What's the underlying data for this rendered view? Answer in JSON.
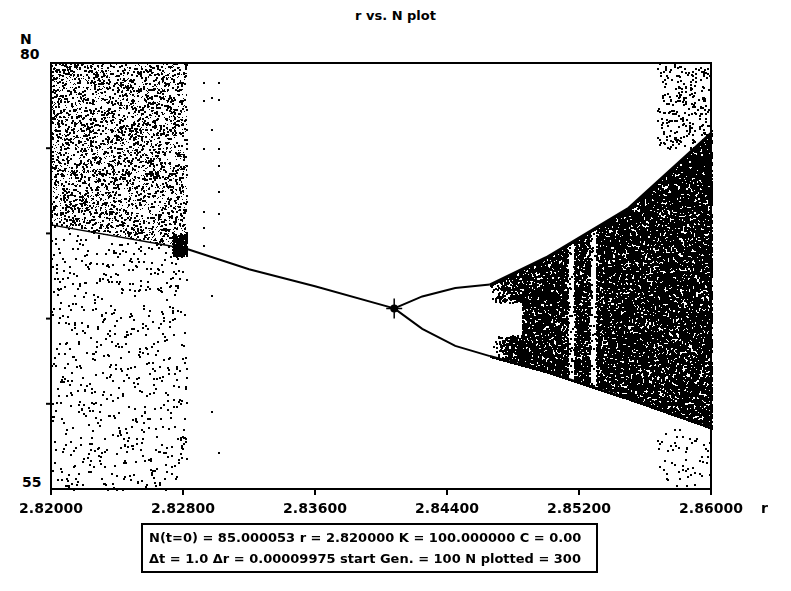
{
  "chart_data": {
    "type": "scatter",
    "title": "r vs. N plot",
    "xlabel": "r",
    "ylabel": "N",
    "xlim": [
      2.82,
      2.86
    ],
    "ylim": [
      55,
      80
    ],
    "x_ticks": [
      "2.82000",
      "2.82800",
      "2.83600",
      "2.84400",
      "2.85200",
      "2.86000"
    ],
    "x_tick_values": [
      2.82,
      2.828,
      2.836,
      2.844,
      2.852,
      2.86
    ],
    "y_tick_labels": [
      "55",
      "80"
    ],
    "y_minor_ticks": [
      60,
      65,
      70,
      75
    ],
    "grid": false,
    "legend": null,
    "features": {
      "chaos_left": {
        "r_range": [
          2.82,
          2.8282
        ],
        "N_range": [
          55,
          80
        ],
        "dense_above_line": [
          [
            2.82,
            70.5
          ],
          [
            2.8282,
            69.1
          ]
        ]
      },
      "stable_branch": [
        [
          2.8282,
          69.1
        ],
        [
          2.832,
          67.9
        ],
        [
          2.836,
          66.9
        ],
        [
          2.8408,
          65.6
        ]
      ],
      "period2_upper": [
        [
          2.8408,
          65.6
        ],
        [
          2.8425,
          66.3
        ],
        [
          2.8445,
          66.8
        ],
        [
          2.8466,
          67.0
        ]
      ],
      "period2_lower": [
        [
          2.8408,
          65.6
        ],
        [
          2.8425,
          64.4
        ],
        [
          2.8445,
          63.4
        ],
        [
          2.8466,
          62.8
        ]
      ],
      "chaos_band_upper": [
        [
          2.8466,
          67.0
        ],
        [
          2.85,
          68.6
        ],
        [
          2.855,
          71.5
        ],
        [
          2.86,
          75.9
        ]
      ],
      "chaos_band_lower": [
        [
          2.8466,
          62.8
        ],
        [
          2.85,
          61.9
        ],
        [
          2.855,
          60.3
        ],
        [
          2.86,
          58.6
        ]
      ],
      "windows_r": [
        2.8515,
        2.8528
      ],
      "sparse_right": {
        "r_range": [
          2.8567,
          2.86
        ]
      }
    },
    "parameters": {
      "N0": "85.000053",
      "r_start": "2.820000",
      "K": "100.000000",
      "C": "0.00",
      "dt": "1.0",
      "dr": "0.00009975",
      "start_gen": "100",
      "n_plotted": "300"
    }
  },
  "title": "r vs. N plot",
  "axes": {
    "y_name": "N",
    "y_max": "80",
    "y_min": "55",
    "x_name": "r",
    "x_ticks": [
      "2.82000",
      "2.82800",
      "2.83600",
      "2.84400",
      "2.85200",
      "2.86000"
    ]
  },
  "params_box": {
    "line1": "N(t=0) = 85.000053  r = 2.820000  K = 100.000000  C = 0.00",
    "line2": "Δt = 1.0  Δr = 0.00009975  start Gen. = 100  N plotted = 300"
  },
  "colors": {
    "ink": "#000000",
    "paper": "#ffffff"
  }
}
